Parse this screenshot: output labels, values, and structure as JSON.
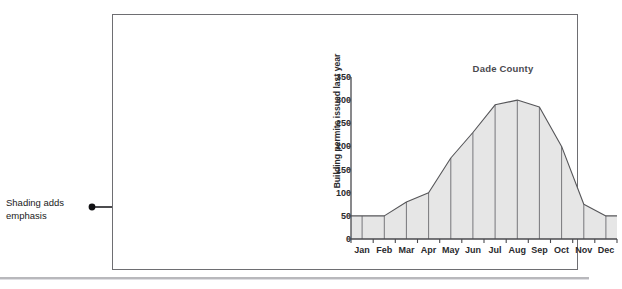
{
  "annotation": {
    "line1": "Shading adds",
    "line2": "emphasis",
    "pointer_icon": "arrow-right-icon",
    "dot_icon": "bullet-dot-icon"
  },
  "chart_data": {
    "type": "area",
    "title": "Dade County",
    "xlabel": "",
    "ylabel": "Building permits issued last year",
    "categories": [
      "Jan",
      "Feb",
      "Mar",
      "Apr",
      "May",
      "Jun",
      "Jul",
      "Aug",
      "Sep",
      "Oct",
      "Nov",
      "Dec"
    ],
    "values": [
      50,
      50,
      80,
      100,
      175,
      230,
      290,
      300,
      285,
      200,
      75,
      50
    ],
    "ylim": [
      0,
      350
    ],
    "ytick_values": [
      0,
      50,
      100,
      150,
      200,
      250,
      300,
      350
    ],
    "ytick_labels": [
      "0",
      "50",
      "100",
      "150",
      "200",
      "250",
      "300",
      "350"
    ],
    "grid": false,
    "legend": null,
    "fill_color": "#e6e6e6",
    "line_color": "#555558",
    "axis_color": "#4a4a4e"
  }
}
